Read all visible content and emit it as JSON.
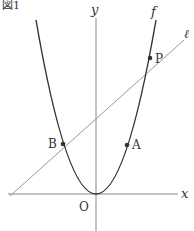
{
  "figure": {
    "caption_partial": "図1",
    "axes": {
      "x_label": "x",
      "y_label": "y",
      "origin_label": "O"
    },
    "curves": {
      "parabola_label": "f",
      "line_label": "ℓ"
    },
    "points": [
      {
        "name": "A",
        "label": "A"
      },
      {
        "name": "B",
        "label": "B"
      },
      {
        "name": "P",
        "label": "P"
      }
    ],
    "colors": {
      "axis": "#888888",
      "curve": "#333333",
      "line": "#999999",
      "text": "#333333"
    }
  }
}
